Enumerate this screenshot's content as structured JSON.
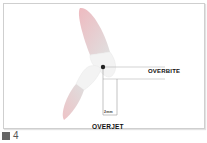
{
  "diagram": {
    "labels": {
      "overbite": "OVERBITE",
      "overjet": "OVERJET",
      "measurement": "2mm"
    },
    "caption": {
      "number": "4"
    },
    "colors": {
      "enamel": "#f4f4f4",
      "root": "#dcdcdc",
      "root_accent": "#e8b8bb",
      "line": "#9a9a9a",
      "point": "#222222"
    }
  }
}
